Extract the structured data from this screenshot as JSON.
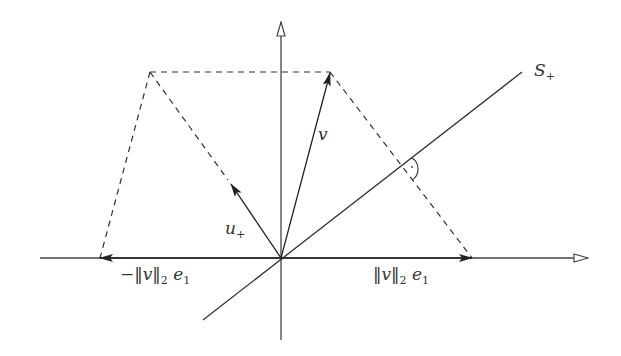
{
  "diagram": {
    "labels": {
      "s_plus": {
        "main": "S",
        "sub": "+"
      },
      "v": "v",
      "u_plus": {
        "main": "u",
        "sub": "+"
      },
      "neg_norm": {
        "prefix": "−‖",
        "var": "v",
        "mid": "‖",
        "sub": "2",
        "e": "e",
        "esub": "1"
      },
      "pos_norm": {
        "prefix": "‖",
        "var": "v",
        "mid": "‖",
        "sub": "2",
        "e": "e",
        "esub": "1"
      }
    },
    "colors": {
      "line": "#333333",
      "axis": "#555555",
      "background": "#ffffff"
    }
  }
}
